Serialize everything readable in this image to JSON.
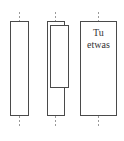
{
  "diagram": {
    "columns": [
      {
        "id": "single",
        "label_lines": []
      },
      {
        "id": "stacked",
        "label_lines": []
      },
      {
        "id": "text",
        "label_lines": [
          "Tu",
          "etwas"
        ]
      }
    ]
  }
}
